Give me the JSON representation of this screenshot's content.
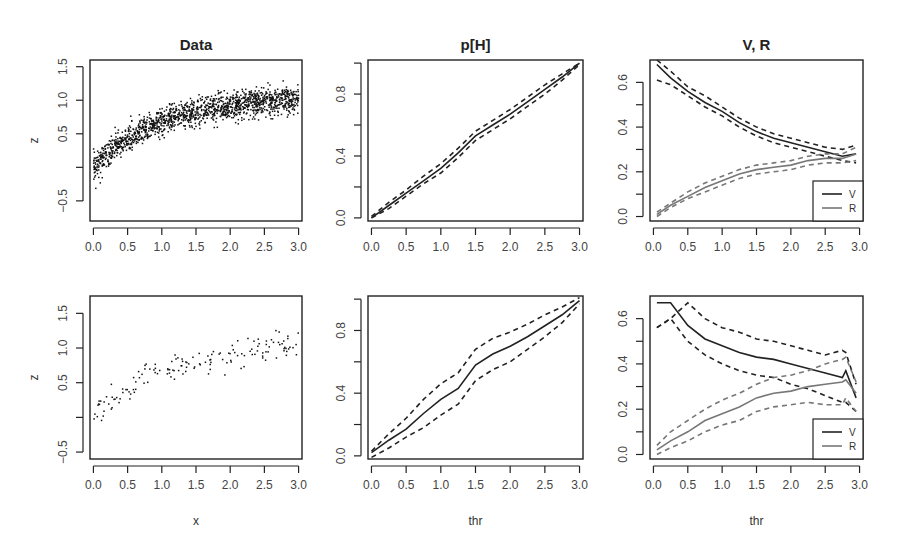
{
  "figure": {
    "width": 897,
    "height": 558,
    "colors": {
      "axis": "#222222",
      "black_series": "#222222",
      "gray_series": "#777777",
      "points": "#111111"
    }
  },
  "chart_data": [
    {
      "id": "data-top",
      "type": "scatter",
      "title": "Data",
      "xlabel": "",
      "ylabel": "z",
      "xlim": [
        -0.05,
        3.05
      ],
      "ylim": [
        -0.8,
        1.6
      ],
      "xticks": [
        0.0,
        0.5,
        1.0,
        1.5,
        2.0,
        2.5,
        3.0
      ],
      "xtick_labels": [
        "0.0",
        "0.5",
        "1.0",
        "1.5",
        "2.0",
        "2.5",
        "3.0"
      ],
      "yticks": [
        -0.5,
        0.0,
        0.5,
        1.0,
        1.5
      ],
      "ytick_labels": [
        "-0.5",
        "",
        "0.5",
        "1.0",
        "1.5"
      ],
      "n_points": 1500,
      "trend": "z ≈ concave increasing from ~0.0 at x=0 to ~0.95 at x=3; noise sd ~0.1",
      "grid": false
    },
    {
      "id": "ph-top",
      "type": "line",
      "title": "p[H]",
      "xlabel": "",
      "ylabel": "",
      "xlim": [
        -0.05,
        3.05
      ],
      "ylim": [
        -0.02,
        1.02
      ],
      "xticks": [
        0.0,
        0.5,
        1.0,
        1.5,
        2.0,
        2.5,
        3.0
      ],
      "xtick_labels": [
        "0.0",
        "0.5",
        "1.0",
        "1.5",
        "2.0",
        "2.5",
        "3.0"
      ],
      "yticks": [
        0.0,
        0.2,
        0.4,
        0.6,
        0.8,
        1.0
      ],
      "ytick_labels": [
        "0.0",
        "",
        "0.4",
        "",
        "0.8",
        ""
      ],
      "x": [
        0.0,
        0.25,
        0.5,
        0.75,
        1.0,
        1.25,
        1.5,
        1.75,
        2.0,
        2.25,
        2.5,
        2.75,
        3.0
      ],
      "series": [
        {
          "name": "estimate",
          "style": "solid",
          "color": "#222222",
          "values": [
            0.0,
            0.08,
            0.16,
            0.24,
            0.32,
            0.42,
            0.53,
            0.6,
            0.67,
            0.75,
            0.83,
            0.91,
            1.0
          ]
        },
        {
          "name": "upper",
          "style": "dashed",
          "color": "#222222",
          "values": [
            0.01,
            0.1,
            0.18,
            0.27,
            0.35,
            0.45,
            0.56,
            0.63,
            0.7,
            0.78,
            0.86,
            0.93,
            1.0
          ]
        },
        {
          "name": "lower",
          "style": "dashed",
          "color": "#222222",
          "values": [
            0.0,
            0.06,
            0.14,
            0.22,
            0.29,
            0.39,
            0.5,
            0.57,
            0.64,
            0.72,
            0.8,
            0.89,
            0.99
          ]
        }
      ],
      "grid": false
    },
    {
      "id": "vr-top",
      "type": "line",
      "title": "V, R",
      "xlabel": "",
      "ylabel": "",
      "xlim": [
        -0.05,
        3.05
      ],
      "ylim": [
        -0.02,
        0.7
      ],
      "xticks": [
        0.0,
        0.5,
        1.0,
        1.5,
        2.0,
        2.5,
        3.0
      ],
      "xtick_labels": [
        "0.0",
        "0.5",
        "1.0",
        "1.5",
        "2.0",
        "2.5",
        "3.0"
      ],
      "yticks": [
        0.0,
        0.1,
        0.2,
        0.3,
        0.4,
        0.5,
        0.6
      ],
      "ytick_labels": [
        "0.0",
        "",
        "0.2",
        "",
        "0.4",
        "",
        "0.6"
      ],
      "x": [
        0.05,
        0.25,
        0.5,
        0.75,
        1.0,
        1.25,
        1.5,
        1.75,
        2.0,
        2.25,
        2.5,
        2.75,
        2.95
      ],
      "series": [
        {
          "name": "V",
          "style": "solid",
          "color": "#222222",
          "values": [
            0.68,
            0.62,
            0.56,
            0.51,
            0.47,
            0.42,
            0.38,
            0.35,
            0.33,
            0.31,
            0.29,
            0.27,
            0.28
          ]
        },
        {
          "name": "V upper",
          "style": "dashed",
          "color": "#222222",
          "values": [
            0.7,
            0.65,
            0.58,
            0.54,
            0.49,
            0.44,
            0.4,
            0.37,
            0.35,
            0.33,
            0.31,
            0.3,
            0.32
          ]
        },
        {
          "name": "V lower",
          "style": "dashed",
          "color": "#222222",
          "values": [
            0.61,
            0.59,
            0.54,
            0.49,
            0.45,
            0.4,
            0.36,
            0.33,
            0.31,
            0.29,
            0.27,
            0.25,
            0.24
          ]
        },
        {
          "name": "R",
          "style": "solid",
          "color": "#777777",
          "values": [
            0.01,
            0.05,
            0.09,
            0.13,
            0.16,
            0.19,
            0.21,
            0.22,
            0.23,
            0.25,
            0.26,
            0.26,
            0.28
          ]
        },
        {
          "name": "R upper",
          "style": "dashed",
          "color": "#777777",
          "values": [
            0.02,
            0.06,
            0.11,
            0.15,
            0.18,
            0.21,
            0.23,
            0.24,
            0.25,
            0.27,
            0.28,
            0.28,
            0.31
          ]
        },
        {
          "name": "R lower",
          "style": "dashed",
          "color": "#777777",
          "values": [
            0.0,
            0.04,
            0.08,
            0.11,
            0.14,
            0.17,
            0.19,
            0.2,
            0.21,
            0.23,
            0.24,
            0.24,
            0.25
          ]
        }
      ],
      "legend": {
        "position": "bottomright",
        "entries": [
          {
            "label": "V",
            "color": "#222222"
          },
          {
            "label": "R",
            "color": "#777777"
          }
        ]
      },
      "grid": false
    },
    {
      "id": "data-bottom",
      "type": "scatter",
      "title": "",
      "xlabel": "x",
      "ylabel": "z",
      "xlim": [
        -0.05,
        3.05
      ],
      "ylim": [
        -0.6,
        1.75
      ],
      "xticks": [
        0.0,
        0.5,
        1.0,
        1.5,
        2.0,
        2.5,
        3.0
      ],
      "xtick_labels": [
        "0.0",
        "0.5",
        "1.0",
        "1.5",
        "2.0",
        "2.5",
        "3.0"
      ],
      "yticks": [
        -0.5,
        0.0,
        0.5,
        1.0,
        1.5
      ],
      "ytick_labels": [
        "-0.5",
        "",
        "0.5",
        "1.0",
        "1.5"
      ],
      "n_points": 150,
      "trend": "same relationship as top panel, sparser sample",
      "grid": false
    },
    {
      "id": "ph-bottom",
      "type": "line",
      "title": "",
      "xlabel": "thr",
      "ylabel": "",
      "xlim": [
        -0.05,
        3.05
      ],
      "ylim": [
        -0.02,
        1.02
      ],
      "xticks": [
        0.0,
        0.5,
        1.0,
        1.5,
        2.0,
        2.5,
        3.0
      ],
      "xtick_labels": [
        "0.0",
        "0.5",
        "1.0",
        "1.5",
        "2.0",
        "2.5",
        "3.0"
      ],
      "yticks": [
        0.0,
        0.2,
        0.4,
        0.6,
        0.8,
        1.0
      ],
      "ytick_labels": [
        "0.0",
        "",
        "0.4",
        "",
        "0.8",
        ""
      ],
      "x": [
        0.0,
        0.25,
        0.5,
        0.75,
        1.0,
        1.25,
        1.5,
        1.75,
        2.0,
        2.25,
        2.5,
        2.75,
        3.0
      ],
      "series": [
        {
          "name": "estimate",
          "style": "solid",
          "color": "#222222",
          "values": [
            0.02,
            0.1,
            0.17,
            0.27,
            0.36,
            0.43,
            0.58,
            0.65,
            0.7,
            0.76,
            0.83,
            0.9,
            0.99
          ]
        },
        {
          "name": "upper",
          "style": "dashed",
          "color": "#222222",
          "values": [
            0.03,
            0.14,
            0.24,
            0.36,
            0.46,
            0.53,
            0.68,
            0.75,
            0.79,
            0.84,
            0.9,
            0.95,
            1.01
          ]
        },
        {
          "name": "lower",
          "style": "dashed",
          "color": "#222222",
          "values": [
            -0.01,
            0.05,
            0.12,
            0.18,
            0.26,
            0.33,
            0.48,
            0.55,
            0.6,
            0.68,
            0.76,
            0.85,
            0.97
          ]
        }
      ],
      "grid": false
    },
    {
      "id": "vr-bottom",
      "type": "line",
      "title": "",
      "xlabel": "thr",
      "ylabel": "",
      "xlim": [
        -0.05,
        3.05
      ],
      "ylim": [
        -0.02,
        0.7
      ],
      "xticks": [
        0.0,
        0.5,
        1.0,
        1.5,
        2.0,
        2.5,
        3.0
      ],
      "xtick_labels": [
        "0.0",
        "0.5",
        "1.0",
        "1.5",
        "2.0",
        "2.5",
        "3.0"
      ],
      "yticks": [
        0.0,
        0.1,
        0.2,
        0.3,
        0.4,
        0.5,
        0.6
      ],
      "ytick_labels": [
        "0.0",
        "",
        "0.2",
        "",
        "0.4",
        "",
        "0.6"
      ],
      "x": [
        0.05,
        0.25,
        0.5,
        0.75,
        1.0,
        1.25,
        1.5,
        1.75,
        2.0,
        2.25,
        2.5,
        2.75,
        2.8,
        2.95
      ],
      "series": [
        {
          "name": "V",
          "style": "solid",
          "color": "#222222",
          "values": [
            0.67,
            0.67,
            0.57,
            0.51,
            0.48,
            0.45,
            0.43,
            0.42,
            0.4,
            0.38,
            0.36,
            0.34,
            0.37,
            0.25
          ]
        },
        {
          "name": "V upper",
          "style": "dashed",
          "color": "#222222",
          "values": [
            0.56,
            0.6,
            0.67,
            0.6,
            0.56,
            0.54,
            0.51,
            0.5,
            0.48,
            0.46,
            0.44,
            0.46,
            0.45,
            0.31
          ]
        },
        {
          "name": "V lower",
          "style": "dashed",
          "color": "#222222",
          "values": [
            0.56,
            0.6,
            0.5,
            0.44,
            0.4,
            0.37,
            0.35,
            0.34,
            0.31,
            0.29,
            0.26,
            0.23,
            0.23,
            0.19
          ]
        },
        {
          "name": "R",
          "style": "solid",
          "color": "#777777",
          "values": [
            0.02,
            0.06,
            0.1,
            0.15,
            0.18,
            0.21,
            0.25,
            0.27,
            0.28,
            0.3,
            0.31,
            0.32,
            0.33,
            0.27
          ]
        },
        {
          "name": "R upper",
          "style": "dashed",
          "color": "#777777",
          "values": [
            0.04,
            0.1,
            0.15,
            0.2,
            0.24,
            0.27,
            0.31,
            0.34,
            0.35,
            0.37,
            0.4,
            0.42,
            0.43,
            0.32
          ]
        },
        {
          "name": "R lower",
          "style": "dashed",
          "color": "#777777",
          "values": [
            0.0,
            0.03,
            0.06,
            0.1,
            0.13,
            0.15,
            0.19,
            0.21,
            0.22,
            0.23,
            0.22,
            0.22,
            0.25,
            0.19
          ]
        }
      ],
      "legend": {
        "position": "bottomright",
        "entries": [
          {
            "label": "V",
            "color": "#222222"
          },
          {
            "label": "R",
            "color": "#777777"
          }
        ]
      },
      "grid": false
    }
  ],
  "panels_layout": [
    {
      "ref": 0,
      "box": [
        90,
        60,
        302,
        221
      ]
    },
    {
      "ref": 1,
      "box": [
        368,
        60,
        583,
        221
      ]
    },
    {
      "ref": 2,
      "box": [
        650,
        60,
        863,
        221
      ]
    },
    {
      "ref": 3,
      "box": [
        90,
        296,
        302,
        459
      ]
    },
    {
      "ref": 4,
      "box": [
        368,
        296,
        583,
        459
      ]
    },
    {
      "ref": 5,
      "box": [
        650,
        296,
        863,
        459
      ]
    }
  ]
}
